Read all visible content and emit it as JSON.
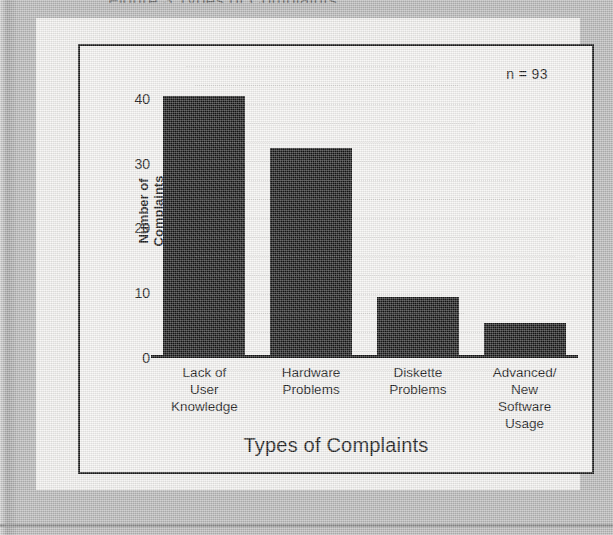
{
  "page": {
    "cut_off_top_text": "Figure 3  Types of Complaints",
    "background_color": "#b9b9b9",
    "paper_color": "#f4f3f1",
    "ink_color": "#141414"
  },
  "figure": {
    "frame_color": "#1a1a1a",
    "annotation": "n = 93"
  },
  "chart_data": {
    "type": "bar",
    "title": "",
    "xlabel": "Types of Complaints",
    "ylabel": "Number of\nComplaints",
    "ylabel_lines": [
      "Number of",
      "Complaints"
    ],
    "categories": [
      "Lack of\nUser\nKnowledge",
      "Hardware\nProblems",
      "Diskette\nProblems",
      "Advanced/\nNew\nSoftware\nUsage"
    ],
    "category_lines": [
      [
        "Lack of",
        "User",
        "Knowledge"
      ],
      [
        "Hardware",
        "Problems"
      ],
      [
        "Diskette",
        "Problems"
      ],
      [
        "Advanced/",
        "New",
        "Software",
        "Usage"
      ]
    ],
    "values": [
      40,
      32,
      9,
      5
    ],
    "ylim": [
      0,
      44
    ],
    "yticks": [
      0,
      10,
      20,
      30,
      40
    ],
    "ytick_labels": [
      "0",
      "10",
      "20",
      "30",
      "40"
    ],
    "grid": false,
    "legend": false,
    "annotations": [
      "n = 93"
    ],
    "bar_color": "#141414"
  }
}
